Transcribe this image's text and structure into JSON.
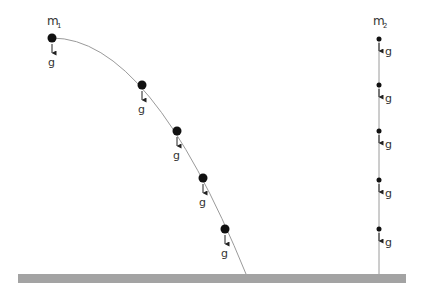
{
  "diagram": {
    "left_object": {
      "label": "m",
      "subscript": "1",
      "positions": [
        {
          "x": 52,
          "y": 38
        },
        {
          "x": 142,
          "y": 85
        },
        {
          "x": 177,
          "y": 131
        },
        {
          "x": 203,
          "y": 178
        },
        {
          "x": 225,
          "y": 229
        }
      ],
      "force_label": "g"
    },
    "right_object": {
      "label": "m",
      "subscript": "2",
      "positions": [
        {
          "x": 379,
          "y": 39
        },
        {
          "x": 379,
          "y": 85
        },
        {
          "x": 379,
          "y": 131
        },
        {
          "x": 379,
          "y": 180
        },
        {
          "x": 379,
          "y": 229
        }
      ],
      "force_label": "g"
    },
    "ground": {
      "color": "#a3a3a3"
    },
    "trajectory_color": "#9a9a9a"
  }
}
